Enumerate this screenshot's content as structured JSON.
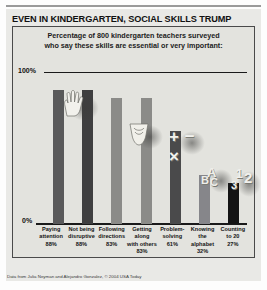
{
  "headline": "EVEN IN KINDERGARTEN, SOCIAL SKILLS TRUMP",
  "subtitle_line1": "Percentage of 800 kindergarten teachers surveyed",
  "subtitle_line2": "who say these skills are essential or very important:",
  "credit": "Data from Julia Neyman and Alejandro Gonzalez, © 2004 USA Today",
  "axis": {
    "top_label": "100%",
    "bottom_label": "0%"
  },
  "decor": {
    "hand_icon": "hand-raised-icon",
    "shoe_icon": "shoe-icon",
    "math_symbols": "+ − ×",
    "abc_letters": "ABC",
    "number_letters": "123"
  },
  "chart_data": {
    "type": "bar",
    "title": "EVEN IN KINDERGARTEN, SOCIAL SKILLS TRUMP",
    "subtitle": "Percentage of 800 kindergarten teachers surveyed who say these skills are essential or very important:",
    "xlabel": "",
    "ylabel": "",
    "ylim": [
      0,
      100
    ],
    "grid": false,
    "legend": "none",
    "categories": [
      "Paying attention",
      "Not being disruptive",
      "Following directions",
      "Getting along with others",
      "Problem-solving",
      "Knowing the alphabet",
      "Counting to 20"
    ],
    "values": [
      88,
      88,
      83,
      83,
      61,
      32,
      27
    ],
    "colors": [
      "#59595a",
      "#3f3f40",
      "#8b8b88",
      "#8b8b88",
      "#4a4a4b",
      "#86868a",
      "#141414"
    ],
    "labels": [
      {
        "line1": "Paying",
        "line2": "attention",
        "line3": "88%"
      },
      {
        "line1": "Not being",
        "line2": "disruptive",
        "line3": "88%"
      },
      {
        "line1": "Following",
        "line2": "directions",
        "line3": "83%"
      },
      {
        "line1": "Getting",
        "line2": "along",
        "line3": "with others",
        "line4": "83%"
      },
      {
        "line1": "Problem-",
        "line2": "solving",
        "line3": "61%"
      },
      {
        "line1": "Knowing",
        "line2": "the",
        "line3": "alphabet",
        "line4": "32%"
      },
      {
        "line1": "Counting",
        "line2": "to 20",
        "line3": "27%"
      }
    ]
  }
}
